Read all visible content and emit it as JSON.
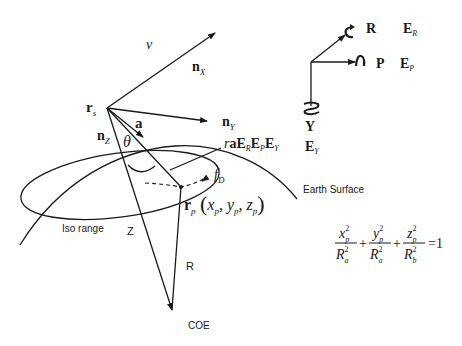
{
  "diagram": {
    "labels": {
      "velocity": "v",
      "n_x": "n",
      "n_x_sub": "X",
      "n_y": "n",
      "n_y_sub": "Y",
      "n_z": "n",
      "n_z_sub": "Z",
      "r_s": "r",
      "r_s_sub": "s",
      "a": "a",
      "theta": "θ",
      "rotation_prefix": "r",
      "rotation_expr": "aE",
      "rotation_sub_r": "R",
      "rotation_ep": "E",
      "rotation_sub_p": "P",
      "rotation_ey": "E",
      "rotation_sub_y": "Y",
      "f_d": "f",
      "f_d_sub": "D",
      "r_p": "r",
      "r_p_sub": "p",
      "r_p_coords": "(x",
      "coord_x_sub": "p",
      "coord_y": ", y",
      "coord_y_sub": "p",
      "coord_z": ", z",
      "coord_z_sub": "p",
      "coord_close": ")",
      "earth_surface": "Earth Surface",
      "iso_range": "Iso range",
      "z_label": "Z",
      "r_label": "R",
      "coe": "COE"
    },
    "attitude_axes": {
      "roll": "R",
      "roll_matrix": "E",
      "roll_sub": "R",
      "pitch": "P",
      "pitch_matrix": "E",
      "pitch_sub": "P",
      "yaw": "Y",
      "yaw_matrix": "E",
      "yaw_sub": "Y"
    },
    "equation": {
      "t1_num": "x",
      "t1_num_sup": "2",
      "t1_num_sub": "p",
      "t1_den": "R",
      "t1_den_sup": "2",
      "t1_den_sub": "a",
      "t2_num": "y",
      "t2_num_sup": "2",
      "t2_num_sub": "p",
      "t2_den": "R",
      "t2_den_sup": "2",
      "t2_den_sub": "a",
      "t3_num": "z",
      "t3_num_sup": "2",
      "t3_num_sub": "p",
      "t3_den": "R",
      "t3_den_sup": "2",
      "t3_den_sub": "b",
      "plus": "+",
      "equals": "=1"
    }
  }
}
